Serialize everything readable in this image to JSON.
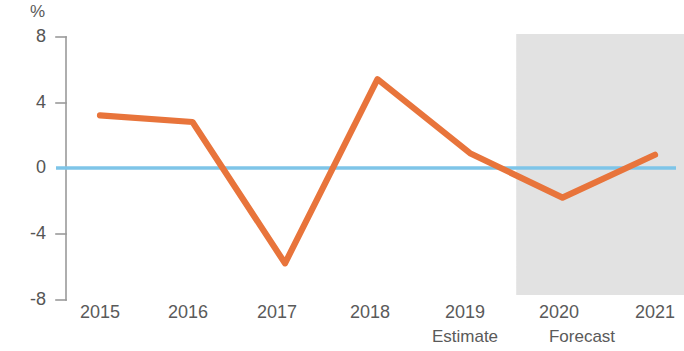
{
  "chart_data": {
    "type": "line",
    "title": "",
    "subtitle": "",
    "xlabel": "",
    "ylabel": "%",
    "unit_label": "%",
    "categories": [
      "2015",
      "2016",
      "2017",
      "2018",
      "2019",
      "2020",
      "2021"
    ],
    "x": [
      2015,
      2016,
      2017,
      2018,
      2019,
      2020,
      2021
    ],
    "series": [
      {
        "name": "Growth rate",
        "color": "#e8743b",
        "values": [
          3.2,
          2.8,
          -5.8,
          5.4,
          0.9,
          -1.8,
          0.8
        ]
      }
    ],
    "values": [
      3.2,
      2.8,
      -5.8,
      5.4,
      0.9,
      -1.8,
      0.8
    ],
    "ylim": [
      -8,
      8
    ],
    "yticks": [
      8,
      4,
      0,
      -4,
      -8
    ],
    "ytick_labels": [
      "8",
      "4",
      "0",
      "-4",
      "-8"
    ],
    "xtick_labels": [
      "2015",
      "2016",
      "2017",
      "2018",
      "2019",
      "2020",
      "2021"
    ],
    "grid": false,
    "legend": "none",
    "zero_line": {
      "value": 0,
      "color": "#7ec5e8"
    },
    "shaded_region": {
      "label": "forecast-band",
      "from_x": 2019.5,
      "to_x": 2021.4,
      "color": "#e8e8e8"
    },
    "annotations": [
      {
        "text": "Estimate",
        "for_category": "2019"
      },
      {
        "text": "Forecast",
        "for_category": "2020"
      }
    ]
  },
  "colors": {
    "line": "#e8743b",
    "zero_line": "#7ec5e8",
    "axis": "#9a9a9a",
    "text": "#5a5a5a",
    "band": "#e8e8e8",
    "background": "#ffffff"
  }
}
